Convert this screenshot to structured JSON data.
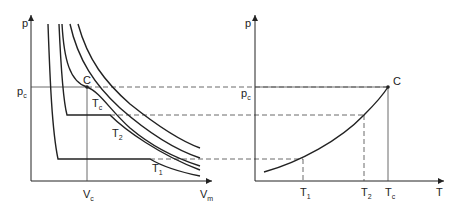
{
  "left_plot": {
    "y_label": "p",
    "x_label": "V",
    "x_label_sub": "m",
    "pc_label": "p",
    "pc_sub": "c",
    "vc_label": "V",
    "vc_sub": "c",
    "critical_point": "C",
    "isotherms": [
      {
        "label": "T",
        "sub": "c"
      },
      {
        "label": "T",
        "sub": "2"
      },
      {
        "label": "T",
        "sub": "1"
      }
    ]
  },
  "right_plot": {
    "y_label": "p",
    "x_label": "T",
    "pc_label": "p",
    "pc_sub": "c",
    "critical_point": "C",
    "x_ticks": [
      {
        "label": "T",
        "sub": "1"
      },
      {
        "label": "T",
        "sub": "2"
      },
      {
        "label": "T",
        "sub": "c"
      }
    ]
  }
}
